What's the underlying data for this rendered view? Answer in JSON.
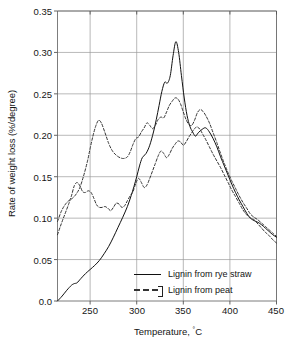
{
  "chart_data": {
    "type": "line",
    "title": "",
    "xlabel": "Temperature, °C",
    "ylabel": "Rate of weight loss (%/degree)",
    "xlim": [
      215,
      450
    ],
    "ylim": [
      0.0,
      0.35
    ],
    "grid": true,
    "legend_position": "inside-bottom-right",
    "xticks": [
      250,
      300,
      350,
      400,
      450
    ],
    "xtick_labels": [
      "250",
      "300",
      "350",
      "400",
      "450"
    ],
    "yticks": [
      0.0,
      0.05,
      0.1,
      0.15,
      0.2,
      0.25,
      0.3,
      0.35
    ],
    "ytick_labels": [
      "0.0",
      "0.05",
      "0.10",
      "0.15",
      "0.20",
      "0.25",
      "0.30",
      "0.35"
    ],
    "series": [
      {
        "name": "Lignin from rye straw",
        "style": "solid",
        "color": "#111111",
        "x": [
          215,
          220,
          225,
          230,
          233,
          236,
          240,
          245,
          250,
          255,
          260,
          265,
          270,
          275,
          280,
          285,
          290,
          294,
          297,
          300,
          303,
          306,
          310,
          314,
          318,
          321,
          324,
          327,
          330,
          333,
          336,
          339,
          342,
          345,
          348,
          351,
          354,
          357,
          360,
          363,
          366,
          370,
          374,
          378,
          382,
          386,
          390,
          394,
          398,
          402,
          406,
          410,
          414,
          418,
          422,
          426,
          430,
          434,
          438,
          442,
          446,
          450
        ],
        "y": [
          0.0,
          0.006,
          0.013,
          0.019,
          0.021,
          0.022,
          0.027,
          0.033,
          0.038,
          0.043,
          0.049,
          0.057,
          0.066,
          0.077,
          0.089,
          0.101,
          0.114,
          0.127,
          0.138,
          0.15,
          0.163,
          0.173,
          0.178,
          0.188,
          0.204,
          0.219,
          0.236,
          0.253,
          0.264,
          0.263,
          0.272,
          0.296,
          0.313,
          0.3,
          0.272,
          0.245,
          0.224,
          0.211,
          0.204,
          0.199,
          0.203,
          0.207,
          0.209,
          0.204,
          0.196,
          0.186,
          0.174,
          0.163,
          0.152,
          0.141,
          0.131,
          0.122,
          0.114,
          0.106,
          0.1,
          0.097,
          0.095,
          0.092,
          0.088,
          0.084,
          0.08,
          0.077
        ]
      },
      {
        "name": "Lignin from peat (upper trace)",
        "style": "dashed",
        "color": "#333333",
        "x": [
          215,
          219,
          223,
          227,
          231,
          235,
          239,
          243,
          247,
          250,
          253,
          256,
          259,
          262,
          266,
          270,
          274,
          278,
          282,
          286,
          290,
          293,
          296,
          299,
          302,
          305,
          308,
          311,
          314,
          317,
          320,
          323,
          326,
          329,
          332,
          335,
          338,
          341,
          344,
          347,
          350,
          353,
          356,
          359,
          362,
          365,
          368,
          371,
          374,
          378,
          382,
          386,
          390,
          394,
          398,
          402,
          406,
          410,
          414,
          418,
          422,
          426,
          430,
          434,
          438,
          442,
          446,
          450
        ],
        "y": [
          0.096,
          0.108,
          0.116,
          0.121,
          0.124,
          0.129,
          0.137,
          0.151,
          0.168,
          0.184,
          0.199,
          0.211,
          0.218,
          0.215,
          0.203,
          0.19,
          0.181,
          0.176,
          0.173,
          0.172,
          0.174,
          0.18,
          0.189,
          0.196,
          0.198,
          0.204,
          0.209,
          0.215,
          0.212,
          0.208,
          0.212,
          0.219,
          0.222,
          0.221,
          0.228,
          0.236,
          0.241,
          0.245,
          0.244,
          0.238,
          0.228,
          0.219,
          0.213,
          0.212,
          0.218,
          0.227,
          0.231,
          0.229,
          0.224,
          0.215,
          0.203,
          0.191,
          0.178,
          0.166,
          0.155,
          0.145,
          0.136,
          0.127,
          0.119,
          0.112,
          0.105,
          0.101,
          0.098,
          0.094,
          0.09,
          0.086,
          0.082,
          0.078
        ]
      },
      {
        "name": "Lignin from peat (lower trace)",
        "style": "dashed",
        "color": "#333333",
        "x": [
          215,
          219,
          223,
          227,
          230,
          233,
          236,
          239,
          242,
          245,
          248,
          251,
          254,
          257,
          260,
          263,
          266,
          269,
          272,
          275,
          278,
          281,
          284,
          287,
          290,
          293,
          296,
          299,
          302,
          305,
          308,
          311,
          314,
          317,
          320,
          323,
          326,
          329,
          332,
          335,
          338,
          341,
          344,
          347,
          350,
          353,
          356,
          359,
          362,
          365,
          368,
          371,
          374,
          378,
          382,
          386,
          390,
          394,
          398,
          402,
          406,
          410,
          414,
          418,
          422,
          426,
          430,
          434,
          438,
          442,
          446,
          450
        ],
        "y": [
          0.08,
          0.093,
          0.105,
          0.117,
          0.127,
          0.139,
          0.143,
          0.139,
          0.132,
          0.131,
          0.133,
          0.131,
          0.124,
          0.116,
          0.113,
          0.113,
          0.114,
          0.112,
          0.109,
          0.113,
          0.118,
          0.117,
          0.113,
          0.115,
          0.121,
          0.127,
          0.132,
          0.142,
          0.148,
          0.143,
          0.137,
          0.14,
          0.148,
          0.157,
          0.166,
          0.175,
          0.181,
          0.178,
          0.173,
          0.177,
          0.184,
          0.189,
          0.193,
          0.192,
          0.188,
          0.192,
          0.198,
          0.203,
          0.208,
          0.21,
          0.207,
          0.201,
          0.195,
          0.186,
          0.177,
          0.169,
          0.161,
          0.152,
          0.143,
          0.134,
          0.126,
          0.118,
          0.11,
          0.104,
          0.1,
          0.098,
          0.093,
          0.088,
          0.083,
          0.079,
          0.074,
          0.07
        ]
      }
    ],
    "legend_entries": [
      {
        "label": "Lignin from rye straw",
        "style": "solid"
      },
      {
        "label": "Lignin from peat",
        "style": "dashed"
      }
    ]
  }
}
